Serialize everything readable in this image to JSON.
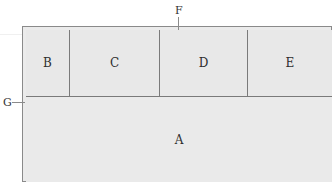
{
  "diagram": {
    "type": "layered-block-diagram",
    "regions": {
      "a": {
        "label": "A",
        "position": "bottom, full width"
      },
      "b": {
        "label": "B",
        "position": "top row, 1st (narrow)"
      },
      "c": {
        "label": "C",
        "position": "top row, 2nd"
      },
      "d": {
        "label": "D",
        "position": "top row, 3rd"
      },
      "e": {
        "label": "E",
        "position": "top row, 4th"
      }
    },
    "callouts": {
      "f": {
        "label": "F",
        "points_to": "top frame layer"
      },
      "g": {
        "label": "G",
        "points_to": "left frame layer"
      }
    },
    "colors": {
      "fill": "#e9e9e9",
      "line": "#7a7a7a",
      "text": "#2e2e2e",
      "background": "#ffffff"
    }
  }
}
